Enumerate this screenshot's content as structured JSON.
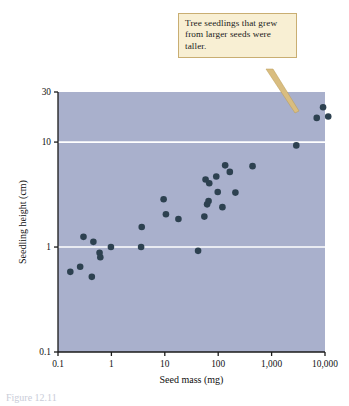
{
  "figure": {
    "caption_partial": "Figure 12.11"
  },
  "callout": {
    "text": "Tree seedlings that grew from larger seeds were taller."
  },
  "colors": {
    "plot_background": "#a9b0cc",
    "point_fill": "#2d4150",
    "gridline": "#ffffff",
    "axis": "#1a1a1a",
    "callout_fill": "#f8efd3",
    "callout_border": "#c9ae72",
    "leader": "#d9bd80"
  },
  "chart_data": {
    "type": "scatter",
    "title": "",
    "xlabel": "Seed mass (mg)",
    "ylabel": "Seedling height (cm)",
    "xscale": "log",
    "yscale": "log",
    "xlim": [
      0.1,
      10000
    ],
    "ylim": [
      0.1,
      30
    ],
    "xticks": [
      0.1,
      1,
      10,
      100,
      1000,
      10000
    ],
    "xtick_labels": [
      "0.1",
      "1",
      "10",
      "100",
      "1,000",
      "10,000"
    ],
    "yticks": [
      0.1,
      1,
      10,
      30
    ],
    "ytick_labels": [
      "0.1",
      "1",
      "10",
      "30"
    ],
    "gridlines_y": [
      1,
      10
    ],
    "grid": "horizontal-only",
    "legend": "none",
    "points": [
      {
        "x": 0.17,
        "y": 0.58
      },
      {
        "x": 0.26,
        "y": 0.65
      },
      {
        "x": 0.3,
        "y": 1.25
      },
      {
        "x": 0.43,
        "y": 0.52
      },
      {
        "x": 0.46,
        "y": 1.12
      },
      {
        "x": 0.6,
        "y": 0.88
      },
      {
        "x": 0.62,
        "y": 0.8
      },
      {
        "x": 0.98,
        "y": 1.0
      },
      {
        "x": 3.6,
        "y": 1.0
      },
      {
        "x": 3.7,
        "y": 1.55
      },
      {
        "x": 9.5,
        "y": 2.85
      },
      {
        "x": 10.5,
        "y": 2.05
      },
      {
        "x": 18.0,
        "y": 1.85
      },
      {
        "x": 42.0,
        "y": 0.92
      },
      {
        "x": 55.0,
        "y": 1.95
      },
      {
        "x": 58.0,
        "y": 4.4
      },
      {
        "x": 62.0,
        "y": 2.55
      },
      {
        "x": 66.0,
        "y": 2.75
      },
      {
        "x": 68.0,
        "y": 4.05
      },
      {
        "x": 92.0,
        "y": 4.7
      },
      {
        "x": 98.0,
        "y": 3.35
      },
      {
        "x": 120.0,
        "y": 2.4
      },
      {
        "x": 135.0,
        "y": 6.0
      },
      {
        "x": 165.0,
        "y": 5.2
      },
      {
        "x": 210.0,
        "y": 3.3
      },
      {
        "x": 440.0,
        "y": 5.9
      },
      {
        "x": 2900.0,
        "y": 9.3
      },
      {
        "x": 7000.0,
        "y": 17.0
      },
      {
        "x": 9200.0,
        "y": 21.5
      },
      {
        "x": 11500.0,
        "y": 17.5
      }
    ]
  }
}
